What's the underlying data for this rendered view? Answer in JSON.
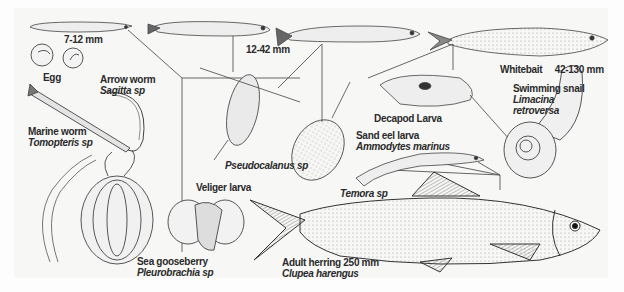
{
  "diagram": {
    "stages": {
      "larva_small": {
        "label": "7-12 mm"
      },
      "larva_mid": {
        "label": "12-42 mm"
      },
      "whitebait": {
        "common": "Whitebait",
        "size": "42-130 mm"
      },
      "adult": {
        "common": "Adult herring 250 mm",
        "scientific": "Clupea harengus"
      }
    },
    "organisms": [
      {
        "id": "egg",
        "common": "Egg"
      },
      {
        "id": "arrow-worm",
        "common": "Arrow worm",
        "scientific": "Sagitta sp"
      },
      {
        "id": "marine-worm",
        "common": "Marine worm",
        "scientific": "Tomopteris sp"
      },
      {
        "id": "sea-gooseberry",
        "common": "Sea gooseberry",
        "scientific": "Pleurobrachia sp"
      },
      {
        "id": "veliger-larva",
        "common": "Veliger larva"
      },
      {
        "id": "pseudocalanus",
        "scientific": "Pseudocalanus sp"
      },
      {
        "id": "decapod-larva",
        "common": "Decapod Larva"
      },
      {
        "id": "sand-eel-larva",
        "common": "Sand eel larva",
        "scientific": "Ammodytes marinus"
      },
      {
        "id": "temora",
        "scientific": "Temora sp"
      },
      {
        "id": "swimming-snail",
        "common": "Swimming snail",
        "scientific": "Limacina retroversa"
      }
    ],
    "colors": {
      "ink": "#2a2a2a",
      "line": "#555555",
      "paper": "#f7f7f6",
      "shade": "#9a9a9a"
    }
  }
}
